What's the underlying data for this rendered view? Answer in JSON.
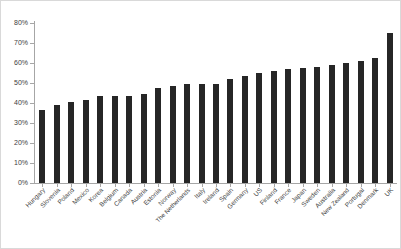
{
  "chart_data": {
    "type": "bar",
    "title": "",
    "subtitle": "",
    "xlabel": "",
    "ylabel": "",
    "ylim": [
      0,
      80
    ],
    "ytick_labels": [
      "0%",
      "10%",
      "20%",
      "30%",
      "40%",
      "50%",
      "60%",
      "70%",
      "80%"
    ],
    "ytick_values": [
      0,
      10,
      20,
      30,
      40,
      50,
      60,
      70,
      80
    ],
    "grid": false,
    "legend": null,
    "bar_color": "#262626",
    "axis_color": "#a6a6a6",
    "background": "#ffffff",
    "value_suffix": "%",
    "categories": [
      "Hungary",
      "Slovenia",
      "Poland",
      "Mexico",
      "Korea",
      "Belgium",
      "Canada",
      "Austria",
      "Estonia",
      "Norway",
      "The Netherlands",
      "Italy",
      "Ireland",
      "Spain",
      "Germany",
      "US",
      "Finland",
      "France",
      "Japan",
      "Sweden",
      "Australia",
      "New Zealand",
      "Portugal",
      "Denmark",
      "UK"
    ],
    "values": [
      36.5,
      39,
      40.5,
      41.5,
      43.5,
      43.5,
      43.5,
      44.5,
      47.5,
      48.5,
      49.5,
      49.5,
      49.5,
      52,
      53.5,
      55,
      56,
      57,
      57.5,
      58,
      59,
      60,
      61,
      62.5,
      75
    ]
  }
}
